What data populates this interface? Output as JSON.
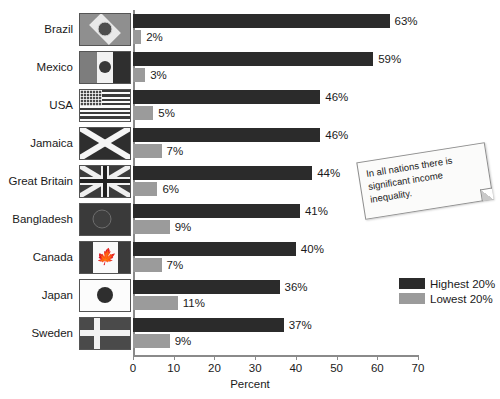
{
  "chart_data": {
    "type": "bar",
    "orientation": "horizontal",
    "title": "",
    "xlabel": "Percent",
    "ylabel": "",
    "xlim": [
      0,
      70
    ],
    "xticks": [
      0,
      10,
      20,
      30,
      40,
      50,
      60,
      70
    ],
    "grid": false,
    "legend_position": "right",
    "categories": [
      "Brazil",
      "Mexico",
      "USA",
      "Jamaica",
      "Great Britain",
      "Bangladesh",
      "Canada",
      "Japan",
      "Sweden"
    ],
    "series": [
      {
        "name": "Highest 20%",
        "color": "#2b2b2b",
        "values": [
          63,
          59,
          46,
          46,
          44,
          41,
          40,
          36,
          37
        ]
      },
      {
        "name": "Lowest 20%",
        "color": "#9b9b9b",
        "values": [
          2,
          3,
          5,
          7,
          6,
          9,
          7,
          11,
          9
        ]
      }
    ],
    "value_labels": {
      "Highest 20%": [
        "63%",
        "59%",
        "46%",
        "46%",
        "44%",
        "41%",
        "40%",
        "36%",
        "37%"
      ],
      "Lowest 20%": [
        "2%",
        "3%",
        "5%",
        "7%",
        "6%",
        "9%",
        "7%",
        "11%",
        "9%"
      ]
    },
    "annotations": [
      {
        "text": "In all nations there is significant income inequality."
      }
    ]
  },
  "rows": [
    {
      "country": "Brazil",
      "flag": "brazil-flag",
      "high": 63,
      "low": 2,
      "high_label": "63%",
      "low_label": "2%"
    },
    {
      "country": "Mexico",
      "flag": "mexico-flag",
      "high": 59,
      "low": 3,
      "high_label": "59%",
      "low_label": "3%"
    },
    {
      "country": "USA",
      "flag": "usa-flag",
      "high": 46,
      "low": 5,
      "high_label": "46%",
      "low_label": "5%"
    },
    {
      "country": "Jamaica",
      "flag": "jamaica-flag",
      "high": 46,
      "low": 7,
      "high_label": "46%",
      "low_label": "7%"
    },
    {
      "country": "Great Britain",
      "flag": "great-britain-flag",
      "high": 44,
      "low": 6,
      "high_label": "44%",
      "low_label": "6%"
    },
    {
      "country": "Bangladesh",
      "flag": "bangladesh-flag",
      "high": 41,
      "low": 9,
      "high_label": "41%",
      "low_label": "9%"
    },
    {
      "country": "Canada",
      "flag": "canada-flag",
      "high": 40,
      "low": 7,
      "high_label": "40%",
      "low_label": "7%"
    },
    {
      "country": "Japan",
      "flag": "japan-flag",
      "high": 36,
      "low": 11,
      "high_label": "36%",
      "low_label": "11%"
    },
    {
      "country": "Sweden",
      "flag": "sweden-flag",
      "high": 37,
      "low": 9,
      "high_label": "37%",
      "low_label": "9%"
    }
  ],
  "axis": {
    "xlabel": "Percent",
    "ticks": [
      "0",
      "10",
      "20",
      "30",
      "40",
      "50",
      "60",
      "70"
    ]
  },
  "legend": {
    "items": [
      {
        "label": "Highest 20%",
        "color": "#2b2b2b"
      },
      {
        "label": "Lowest 20%",
        "color": "#9b9b9b"
      }
    ]
  },
  "note": {
    "text": "In all nations there is significant income inequality."
  }
}
